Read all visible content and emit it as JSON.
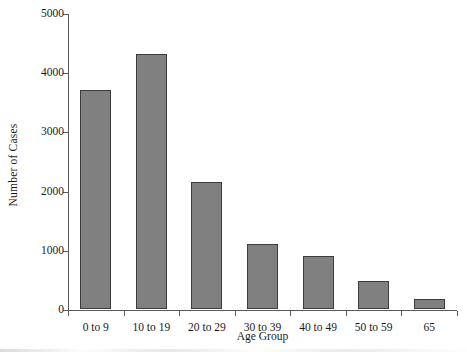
{
  "chart_data": {
    "type": "bar",
    "title": "",
    "xlabel": "Age Group",
    "ylabel": "Number of Cases",
    "categories": [
      "0 to  9",
      "10 to 19",
      "20 to 29",
      "30 to 39",
      "40 to 49",
      "50 to 59",
      "65"
    ],
    "values": [
      3700,
      4300,
      2150,
      1100,
      900,
      470,
      170
    ],
    "ylim": [
      0,
      5000
    ],
    "ytick_labels": [
      "0",
      "1000",
      "2000",
      "3000",
      "4000",
      "5000"
    ],
    "ytick_values": [
      0,
      1000,
      2000,
      3000,
      4000,
      5000
    ],
    "grid": false,
    "legend": false,
    "legend_position": "none",
    "bar_color": "#808080",
    "bar_edge_color": "#3d3d3d",
    "axis_color": "#5a5a5a",
    "background_color": "#ffffff"
  }
}
